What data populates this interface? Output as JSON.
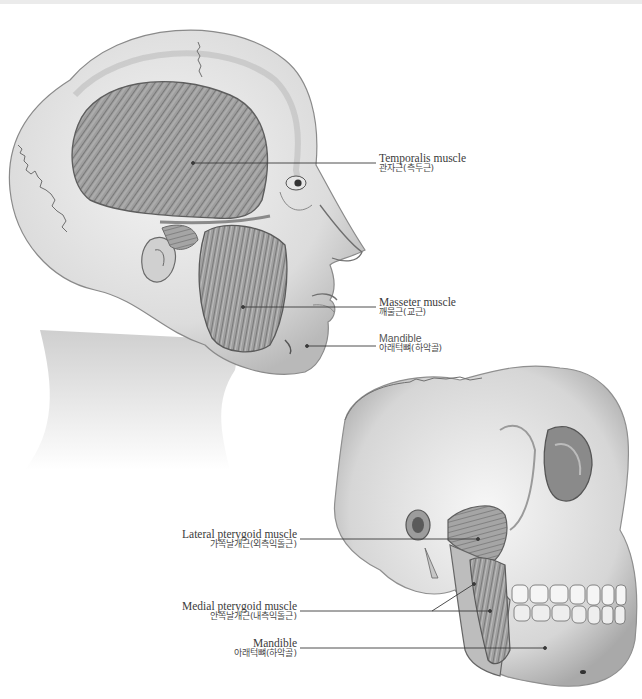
{
  "figure": {
    "type": "anatomical-illustration",
    "colors": {
      "background": "#ffffff",
      "top_strip": "#ebebeb",
      "illustration": "#9a9a9a",
      "leader_line": "#3a3a3a",
      "label_text": "#3b3b3b"
    }
  },
  "head_view": {
    "labels": [
      {
        "id": "temporalis",
        "en": "Temporalis muscle",
        "ko": "관자근(측두근)"
      },
      {
        "id": "masseter",
        "en": "Masseter muscle",
        "ko": "깨물근(교근)"
      },
      {
        "id": "mandible",
        "en": "Mandible",
        "ko": "아래턱뼈(하악골)"
      }
    ]
  },
  "skull_view": {
    "labels": [
      {
        "id": "lateral-pterygoid",
        "en": "Lateral pterygoid muscle",
        "ko": "가쪽날개근(외측익돌근)"
      },
      {
        "id": "medial-pterygoid",
        "en": "Medial pterygoid muscle",
        "ko": "안쪽날개근(내측익돌근)"
      },
      {
        "id": "mandible",
        "en": "Mandible",
        "ko": "아래턱뼈(하악골)"
      }
    ]
  }
}
